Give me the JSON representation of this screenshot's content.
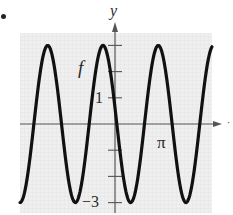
{
  "chart_data": {
    "type": "line",
    "title": "",
    "xlabel": "",
    "ylabel": "y",
    "curve_label": "f",
    "series": [
      {
        "name": "f",
        "description": "sinusoid with amplitude 3, oscillating between y = -3 and y = 3",
        "amplitude": 3,
        "midline": 0,
        "x": [
          -2.97,
          -2.07,
          -1.2,
          -0.38,
          -0.13,
          0.47,
          1.35,
          2.22,
          3.08,
          3.77
        ],
        "y": [
          -3,
          3,
          -3,
          3,
          1.8,
          -3,
          3,
          -3,
          3,
          3
        ],
        "peaks_x": [
          -2.14,
          -0.38,
          1.38,
          3.08
        ],
        "troughs_x": [
          -2.98,
          -1.26,
          0.47,
          2.2
        ]
      }
    ],
    "y_ticks": [
      3,
      2,
      1,
      0,
      -1,
      -2,
      -3
    ],
    "y_tick_labels": [
      {
        "value": 1,
        "text": "1"
      },
      {
        "value": -3,
        "text": "−3"
      }
    ],
    "x_tick_labels": [
      {
        "value": 3.14159,
        "text": "π"
      }
    ],
    "ylim": [
      -3.4,
      3.6
    ],
    "xlim": [
      -3.0,
      3.8
    ],
    "grid": true,
    "legend": "none"
  },
  "labels": {
    "y_axis": "y",
    "curve": "f",
    "y_one": "1",
    "y_neg_three": "−3",
    "x_pi": "π"
  },
  "style": {
    "curve_color": "#111111",
    "axis_color": "#555555",
    "grid_bg": "#eeeeee",
    "grid_line": "#dedede"
  },
  "pixel_model": {
    "origin_x": 115,
    "origin_y": 124,
    "px_per_y_unit": 26.2,
    "px_per_pi": 50,
    "curve_peak_x_px": 103,
    "curve_period_px": 55.3,
    "curve_amp_px": 78.5,
    "plot_left": 20,
    "plot_right": 212,
    "plot_top": 33,
    "plot_bottom": 213
  }
}
